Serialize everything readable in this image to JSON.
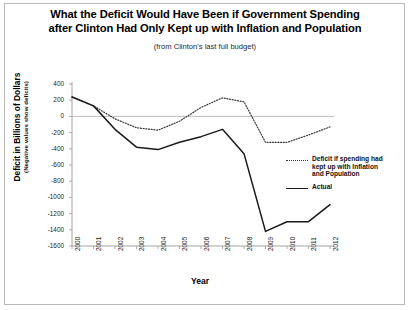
{
  "figure": {
    "title_line_1": "What the Deficit Would Have Been if Government Spending",
    "title_line_2": "after Clinton Had Only Kept up with Inflation and Population",
    "subtitle": "(from Clinton's last full budget)"
  },
  "legend": {
    "position": "right-inside",
    "entries": [
      {
        "style": "dotted",
        "line_1": "Deficit if spending had",
        "line_2": "kept up with Inflation",
        "line_3": "and Population"
      },
      {
        "style": "solid",
        "line_1": "Actual"
      }
    ]
  },
  "chart_data": {
    "type": "line",
    "title": "What the Deficit Would Have Been if Government Spending after Clinton Had Only Kept up with Inflation and Population",
    "subtitle": "(from Clinton's last full budget)",
    "xlabel": "Year",
    "ylabel": "Deficit in Billions of Dollars",
    "ylabel_sub": "(Negative values show deficits)",
    "x": [
      2000,
      2001,
      2002,
      2003,
      2004,
      2005,
      2006,
      2007,
      2008,
      2009,
      2010,
      2011,
      2012
    ],
    "xtick_labels": [
      "2000",
      "2001",
      "2002",
      "2003",
      "2004",
      "2005",
      "2006",
      "2007",
      "2008",
      "2009",
      "2010",
      "2011",
      "2012"
    ],
    "ylim": [
      -1600,
      400
    ],
    "ytick_values": [
      400,
      200,
      0,
      -200,
      -400,
      -600,
      -800,
      -1000,
      -1200,
      -1400,
      -1600
    ],
    "ytick_labels": [
      "400",
      "200",
      "0",
      "-200",
      "-400",
      "-600",
      "-800",
      "-1000",
      "-1200",
      "-1400",
      "-1600"
    ],
    "grid": false,
    "zero_line": true,
    "series": [
      {
        "name": "Deficit if spending had kept up with Inflation and Population",
        "style": "dotted",
        "color": "#3a3a3a",
        "values": [
          240,
          130,
          -30,
          -140,
          -170,
          -60,
          110,
          230,
          180,
          -320,
          -320,
          -230,
          -130
        ]
      },
      {
        "name": "Actual",
        "style": "solid",
        "color": "#1a1a1a",
        "values": [
          240,
          130,
          -160,
          -380,
          -410,
          -320,
          -250,
          -160,
          -460,
          -1420,
          -1300,
          -1300,
          -1090
        ]
      }
    ]
  }
}
